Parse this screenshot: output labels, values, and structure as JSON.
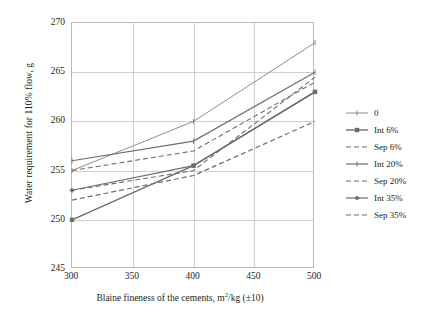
{
  "chart_data": {
    "type": "line",
    "title": "",
    "xlabel": "Blaine fineness of the cements, m2/kg (±10)",
    "xlabel_parts": {
      "pre": "Blaine fineness of the cements, m",
      "sup": "2",
      "post": "/kg (±10)"
    },
    "ylabel": "Water requirement for 110% flow, g",
    "x": [
      300,
      400,
      500
    ],
    "xlim": [
      300,
      500
    ],
    "ylim": [
      245,
      270
    ],
    "xticks": [
      "300",
      "350",
      "400",
      "450",
      "500"
    ],
    "yticks": [
      "270",
      "265",
      "260",
      "255",
      "250",
      "245"
    ],
    "grid": true,
    "legend_position": "right",
    "series": [
      {
        "name": "0",
        "values": [
          255,
          260,
          268
        ],
        "color": "#7f7f7f",
        "style": "solid",
        "width": 0.9,
        "marker": "plus"
      },
      {
        "name": "Int 6%",
        "values": [
          250,
          255.5,
          263
        ],
        "color": "#6e6e6e",
        "style": "solid",
        "width": 1.4,
        "marker": "square"
      },
      {
        "name": "Sep 6%",
        "values": [
          252,
          254.5,
          260
        ],
        "color": "#6e6e6e",
        "style": "dashed",
        "width": 1.2,
        "marker": "none"
      },
      {
        "name": "Int 20%",
        "values": [
          256,
          258,
          265
        ],
        "color": "#6e6e6e",
        "style": "solid",
        "width": 1.2,
        "marker": "tick"
      },
      {
        "name": "Sep 20%",
        "values": [
          255,
          257,
          264
        ],
        "color": "#6e6e6e",
        "style": "dashed",
        "width": 1.1,
        "marker": "none"
      },
      {
        "name": "Int 35%",
        "values": [
          253,
          255.5,
          263
        ],
        "color": "#6e6e6e",
        "style": "solid",
        "width": 1.2,
        "marker": "diamond"
      },
      {
        "name": "Sep 35%",
        "values": [
          253,
          255,
          264.5
        ],
        "color": "#6e6e6e",
        "style": "dashed",
        "width": 1.1,
        "marker": "none"
      }
    ]
  },
  "axes": {
    "frame_color": "#b9b9b9",
    "grid_color": "#cfcfcf"
  }
}
